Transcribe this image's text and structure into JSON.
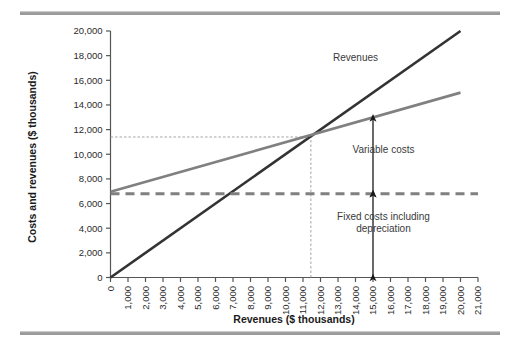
{
  "figure": {
    "top_rule_color": "#9a9a9a",
    "bottom_rule_color": "#9a9a9a",
    "background": "#ffffff"
  },
  "chart_data": {
    "type": "line",
    "title": "",
    "subtitle": "",
    "xlabel": "Revenues ($ thousands)",
    "ylabel": "Costs and revenues ($ thousands)",
    "xlim": [
      0,
      21000
    ],
    "ylim": [
      0,
      20000
    ],
    "grid": false,
    "legend_position": "inline-annotation",
    "x_ticks": [
      0,
      1000,
      2000,
      3000,
      4000,
      5000,
      6000,
      7000,
      8000,
      9000,
      10000,
      11000,
      12000,
      13000,
      14000,
      15000,
      16000,
      17000,
      18000,
      19000,
      20000,
      21000
    ],
    "x_tick_labels": [
      "0",
      "1,000",
      "2,000",
      "3,000",
      "4,000",
      "5,000",
      "6,000",
      "7,000",
      "8,000",
      "9,000",
      "10,000",
      "11,000",
      "12,000",
      "13,000",
      "14,000",
      "15,000",
      "16,000",
      "17,000",
      "18,000",
      "19,000",
      "20,000",
      "21,000"
    ],
    "y_ticks": [
      0,
      2000,
      4000,
      6000,
      8000,
      10000,
      12000,
      14000,
      16000,
      18000,
      20000
    ],
    "y_tick_labels": [
      "0",
      "2,000",
      "4,000",
      "6,000",
      "8,000",
      "10,000",
      "12,000",
      "14,000",
      "16,000",
      "18,000",
      "20,000"
    ],
    "series": [
      {
        "name": "Revenues",
        "color": "#333333",
        "style": "solid",
        "width": 2.6,
        "x": [
          0,
          20000
        ],
        "values": [
          0,
          20000
        ]
      },
      {
        "name": "Total costs",
        "color": "#808080",
        "style": "solid",
        "width": 2.6,
        "x": [
          0,
          20000
        ],
        "values": [
          6950,
          15000
        ]
      },
      {
        "name": "Fixed costs including depreciation",
        "color": "#808080",
        "style": "dashed",
        "width": 3.0,
        "x": [
          0,
          21000
        ],
        "values": [
          6800,
          6800
        ]
      }
    ],
    "annotations": [
      {
        "id": "revenues-label",
        "text": "Revenues",
        "x": 14000,
        "y": 17600
      },
      {
        "id": "variable-costs-label",
        "text": "Variable costs",
        "x": 15600,
        "y": 10100
      },
      {
        "id": "fixed-costs-label-line1",
        "text": "Fixed costs including",
        "x": 15600,
        "y": 4700
      },
      {
        "id": "fixed-costs-label-line2",
        "text": "depreciation",
        "x": 15600,
        "y": 3700
      }
    ],
    "guides": [
      {
        "id": "breakeven-horizontal",
        "orientation": "horizontal",
        "value": 11400,
        "from": 0,
        "to": 11450,
        "style": "dotted",
        "color": "#9a9a9a"
      },
      {
        "id": "breakeven-vertical",
        "orientation": "vertical",
        "value": 11450,
        "from": 0,
        "to": 11400,
        "style": "dotted",
        "color": "#9a9a9a"
      }
    ],
    "measure_arrows": [
      {
        "id": "variable-costs-arrow",
        "x": 15000,
        "y_from": 6800,
        "y_to": 12950,
        "color": "#1a1a1a"
      },
      {
        "id": "fixed-costs-arrow",
        "x": 15000,
        "y_from": 0,
        "y_to": 6800,
        "color": "#1a1a1a"
      }
    ],
    "breakeven_point": {
      "x": 11450,
      "y": 11400
    }
  }
}
